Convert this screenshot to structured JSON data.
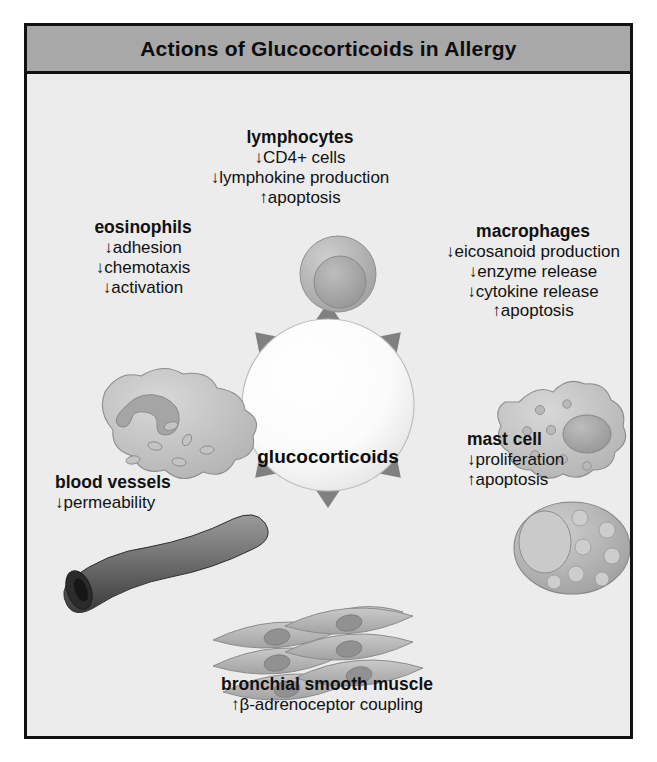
{
  "figure": {
    "title": "Actions of Glucocorticoids in Allergy",
    "center": {
      "label": "glucocorticoids"
    },
    "targets": [
      {
        "id": "lymphocytes",
        "heading": "lymphocytes",
        "effects": [
          "↓CD4+ cells",
          "↓lymphokine production",
          "↑apoptosis"
        ],
        "icon": "lymphocyte-cell-icon"
      },
      {
        "id": "macrophages",
        "heading": "macrophages",
        "effects": [
          "↓eicosanoid production",
          "↓enzyme release",
          "↓cytokine release",
          "↑apoptosis"
        ],
        "icon": "macrophage-cell-icon"
      },
      {
        "id": "eosinophils",
        "heading": "eosinophils",
        "effects": [
          "↓adhesion",
          "↓chemotaxis",
          "↓activation"
        ],
        "icon": "eosinophil-cell-icon"
      },
      {
        "id": "mast-cell",
        "heading": "mast cell",
        "effects": [
          "↓proliferation",
          "↑apoptosis"
        ],
        "icon": "mast-cell-icon"
      },
      {
        "id": "blood-vessels",
        "heading": "blood vessels",
        "effects": [
          "↓permeability"
        ],
        "icon": "blood-vessel-icon"
      },
      {
        "id": "bronchial-smooth-muscle",
        "heading": "bronchial smooth muscle",
        "effects": [
          "↑β-adrenoceptor coupling"
        ],
        "icon": "smooth-muscle-cells-icon"
      }
    ],
    "colors": {
      "title_bar": "#a8a8a8",
      "frame_border": "#111111",
      "body_background": "#ececec",
      "arrow": "#808080",
      "center_circle": "#fbfbfb",
      "cell_fill": "#b4b4b4",
      "text": "#111111"
    }
  }
}
